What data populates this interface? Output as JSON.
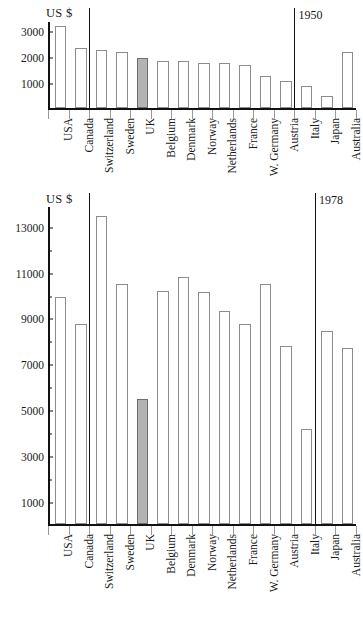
{
  "chart_data": [
    {
      "id": "chart-1950",
      "type": "bar",
      "title": "",
      "year_annotation": "1950",
      "ylabel": "US $",
      "xlabel": "",
      "ylim": [
        0,
        3400
      ],
      "yticks": [
        1000,
        2000,
        3000
      ],
      "ytick_labels": [
        "1000",
        "2000",
        "3000"
      ],
      "grid": false,
      "legend": "none",
      "categories": [
        "USA",
        "Canada",
        "Switzerland",
        "Sweden",
        "UK",
        "Belgium",
        "Denmark",
        "Norway",
        "Netherlands",
        "France",
        "W. Germany",
        "Austria",
        "Italy",
        "Japan",
        "Australia"
      ],
      "values": [
        3150,
        2330,
        2260,
        2160,
        1950,
        1830,
        1820,
        1740,
        1730,
        1650,
        1230,
        1050,
        840,
        450,
        2180
      ],
      "highlight_category": "UK",
      "group_dividers_after": [
        "Canada",
        "Austria"
      ]
    },
    {
      "id": "chart-1978",
      "type": "bar",
      "title": "",
      "year_annotation": "1978",
      "ylabel": "US $",
      "xlabel": "",
      "ylim": [
        0,
        13900
      ],
      "yticks": [
        1000,
        2000,
        3000,
        4000,
        5000,
        6000,
        7000,
        8000,
        9000,
        10000,
        11000,
        12000,
        13000
      ],
      "ytick_labels": [
        "1000",
        "",
        "3000",
        "",
        "5000",
        "",
        "7000",
        "",
        "9000",
        "",
        "11000",
        "",
        "13000"
      ],
      "grid": false,
      "legend": "none",
      "categories": [
        "USA",
        "Canada",
        "Switzerland",
        "Sweden",
        "UK",
        "Belgium",
        "Denmark",
        "Norway",
        "Netherlands",
        "France",
        "W. Germany",
        "Austria",
        "Italy",
        "Japan",
        "Australia"
      ],
      "values": [
        9900,
        8700,
        13400,
        10450,
        5450,
        10150,
        10750,
        10100,
        9300,
        8700,
        10450,
        7750,
        4150,
        8400,
        7650
      ],
      "highlight_category": "UK",
      "group_dividers_after": [
        "Canada",
        "Italy"
      ]
    }
  ],
  "colors": {
    "axis": "#111111",
    "bar_fill": "#ffffff",
    "bar_stroke": "#8c8c8c",
    "highlight_fill": "#b4b4b4",
    "background": "#ffffff"
  }
}
